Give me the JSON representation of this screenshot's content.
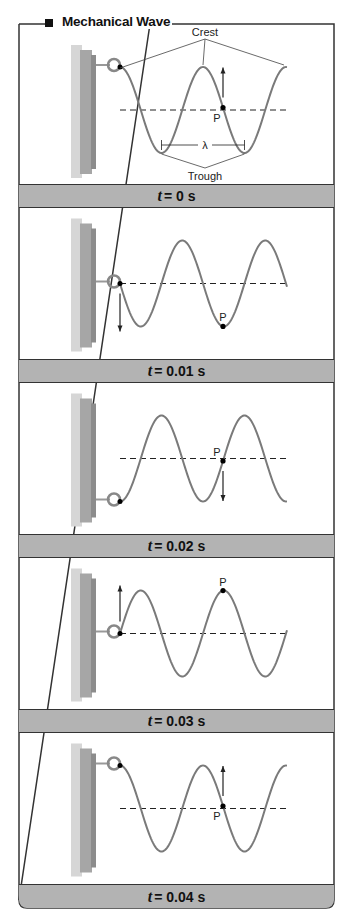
{
  "figure": {
    "title": "Mechanical Wave",
    "colors": {
      "frame": "#333333",
      "caption_bg": "#b3b3b3",
      "wave": "#7a7a7a",
      "wall_light": "#d6d6d6",
      "wall_dark": "#8c8c8c"
    }
  },
  "labels": {
    "crest": "Crest",
    "trough": "Trough",
    "wavelength": "λ",
    "point": "P"
  },
  "panels": [
    {
      "t_var": "t",
      "t_eq": "= 0 s",
      "point_position": "equilibrium",
      "point_motion": "up",
      "source_motion": "none",
      "source_position": "crest"
    },
    {
      "t_var": "t",
      "t_eq": "= 0.01 s",
      "point_position": "crest",
      "point_motion": "none",
      "source_motion": "down",
      "source_position": "equilibrium"
    },
    {
      "t_var": "t",
      "t_eq": "= 0.02 s",
      "point_position": "equilibrium",
      "point_motion": "down",
      "source_motion": "none",
      "source_position": "trough"
    },
    {
      "t_var": "t",
      "t_eq": "= 0.03 s",
      "point_position": "trough",
      "point_motion": "none",
      "source_motion": "up",
      "source_position": "equilibrium"
    },
    {
      "t_var": "t",
      "t_eq": "= 0.04 s",
      "point_position": "equilibrium",
      "point_motion": "up",
      "source_motion": "none",
      "source_position": "crest"
    }
  ]
}
